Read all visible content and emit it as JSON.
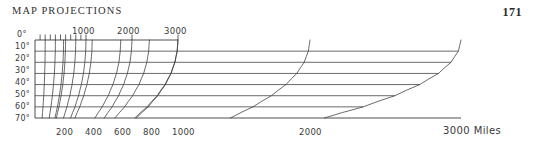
{
  "page": {
    "running_head": "MAP PROJECTIONS",
    "folio": "171",
    "background_color": "#ffffff",
    "ink_color": "#3a3a3a"
  },
  "chart_data": {
    "type": "line",
    "title": "",
    "subtitle": "",
    "xlabel": "Miles",
    "ylabel": "",
    "grid": true,
    "legend": false,
    "legend_position": "none",
    "axis_style": "top-and-bottom distance scales with latitude gridlines",
    "xlim": [
      0,
      3000
    ],
    "ylim": [
      0,
      70
    ],
    "y_axis_invert": true,
    "top_axis": {
      "name": "top-distance-axis",
      "label": "",
      "tick_labels": [
        "1000",
        "2000",
        "3000"
      ],
      "tick_label_values": [
        1000,
        2000,
        3000
      ],
      "minor_ticks": [
        100,
        200,
        300,
        400,
        500,
        600,
        700,
        800,
        900,
        1000,
        2000,
        3000
      ],
      "max": 3000
    },
    "bottom_axis": {
      "name": "bottom-distance-axis",
      "label": "Miles",
      "tick_labels": [
        "200",
        "400",
        "600",
        "800",
        "1000",
        "2000",
        "3000"
      ],
      "tick_label_values": [
        200,
        400,
        600,
        800,
        1000,
        2000,
        3000
      ],
      "units_label": "3000 Miles",
      "max": 3000
    },
    "left_axis": {
      "name": "latitude-axis",
      "label": "",
      "tick_labels": [
        "0°",
        "10°",
        "20°",
        "30°",
        "40°",
        "50°",
        "60°",
        "70°"
      ],
      "tick_label_values": [
        0,
        10,
        20,
        30,
        40,
        50,
        60,
        70
      ]
    },
    "gridlines": {
      "horizontal_values": [
        0,
        10,
        20,
        30,
        40,
        50,
        60,
        70
      ],
      "note": "each latitude gridline is drawn from the left axis only as far right as the curve that terminates on it"
    },
    "series": [
      {
        "name": "200 miles",
        "value": 200,
        "x": [
          200,
          199,
          196,
          190,
          182,
          171,
          157,
          140
        ],
        "y": [
          0,
          10,
          20,
          30,
          40,
          50,
          60,
          70
        ]
      },
      {
        "name": "400 miles",
        "value": 400,
        "x": [
          400,
          398,
          391,
          380,
          363,
          341,
          313,
          279
        ],
        "y": [
          0,
          10,
          20,
          30,
          40,
          50,
          60,
          70
        ]
      },
      {
        "name": "600 miles",
        "value": 600,
        "x": [
          600,
          596,
          587,
          570,
          545,
          512,
          470,
          419
        ],
        "y": [
          0,
          10,
          20,
          30,
          40,
          50,
          60,
          70
        ]
      },
      {
        "name": "800 miles",
        "value": 800,
        "x": [
          800,
          795,
          782,
          760,
          727,
          683,
          627,
          559
        ],
        "y": [
          0,
          10,
          20,
          30,
          40,
          50,
          60,
          70
        ]
      },
      {
        "name": "1000 miles",
        "value": 1000,
        "x": [
          1000,
          994,
          978,
          950,
          909,
          854,
          784,
          698
        ],
        "y": [
          0,
          10,
          20,
          30,
          40,
          50,
          60,
          70
        ]
      },
      {
        "name": "2000 miles",
        "value": 2000,
        "x": [
          2000,
          1988,
          1956,
          1900,
          1818,
          1708,
          1568,
          1397
        ],
        "y": [
          0,
          10,
          20,
          30,
          40,
          50,
          60,
          70
        ]
      },
      {
        "name": "3000 miles",
        "value": 3000,
        "x": [
          3000,
          2983,
          2934,
          2851,
          2727,
          2562,
          2352,
          2095
        ],
        "y": [
          0,
          10,
          20,
          30,
          40,
          50,
          60,
          70
        ]
      }
    ]
  }
}
